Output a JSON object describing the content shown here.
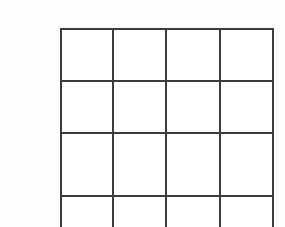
{
  "page": {
    "background_color": "#fdfdfd",
    "width": 285,
    "height": 227
  },
  "grid": {
    "name": "blank-grid",
    "line_color": "#3c3c3c",
    "line_width": 2,
    "fill_color": "#ffffff",
    "columns": 4,
    "rows_visible": 3,
    "rows_partial": 1,
    "clipped_at_bottom": true,
    "x_positions": [
      60,
      112,
      165,
      219,
      272
    ],
    "y_positions": [
      28,
      80,
      132,
      195,
      258
    ],
    "cells": [
      {
        "row": 0,
        "col": 0,
        "text": ""
      },
      {
        "row": 0,
        "col": 1,
        "text": ""
      },
      {
        "row": 0,
        "col": 2,
        "text": ""
      },
      {
        "row": 0,
        "col": 3,
        "text": ""
      },
      {
        "row": 1,
        "col": 0,
        "text": ""
      },
      {
        "row": 1,
        "col": 1,
        "text": ""
      },
      {
        "row": 1,
        "col": 2,
        "text": ""
      },
      {
        "row": 1,
        "col": 3,
        "text": ""
      },
      {
        "row": 2,
        "col": 0,
        "text": ""
      },
      {
        "row": 2,
        "col": 1,
        "text": ""
      },
      {
        "row": 2,
        "col": 2,
        "text": ""
      },
      {
        "row": 2,
        "col": 3,
        "text": ""
      },
      {
        "row": 3,
        "col": 0,
        "text": ""
      },
      {
        "row": 3,
        "col": 1,
        "text": ""
      },
      {
        "row": 3,
        "col": 2,
        "text": ""
      },
      {
        "row": 3,
        "col": 3,
        "text": ""
      }
    ]
  }
}
